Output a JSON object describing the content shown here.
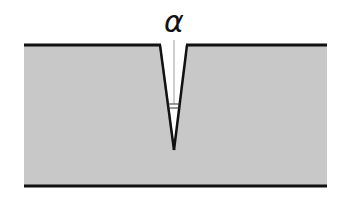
{
  "diagram": {
    "angle_label": "α",
    "colors": {
      "plate_fill": "#c8c8c8",
      "outline": "#111111",
      "background": "#ffffff",
      "guide": "#888888"
    },
    "plate": {
      "left": 24,
      "right": 327,
      "top": 45,
      "bottom": 186
    },
    "notch": {
      "top_left_x": 160,
      "top_right_x": 187,
      "tip_x": 174,
      "tip_y": 150
    }
  }
}
